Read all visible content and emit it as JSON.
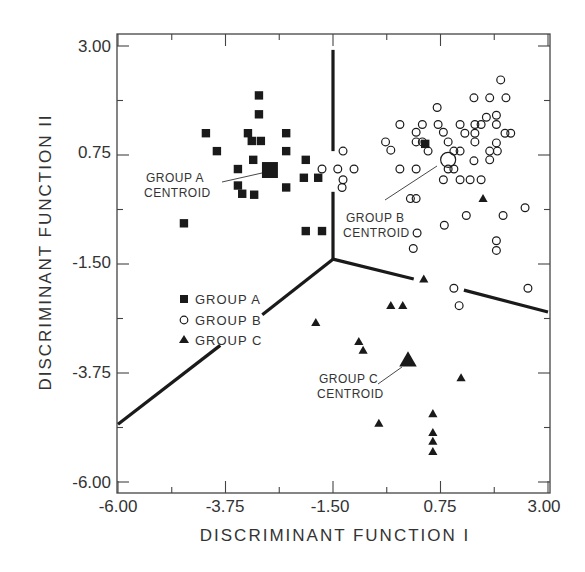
{
  "chart_data": {
    "type": "scatter",
    "title": "",
    "xlabel": "DISCRIMINANT FUNCTION I",
    "ylabel": "DISCRIMINANT FUNCTION II",
    "xlim": [
      -6.0,
      3.0
    ],
    "ylim": [
      -6.0,
      3.0
    ],
    "x_ticks": [
      "-6.00",
      "-3.75",
      "-1.50",
      "0.75",
      "3.00"
    ],
    "y_ticks": [
      "3.00",
      "0.75",
      "-1.50",
      "-3.75",
      "-6.00"
    ],
    "grid": false,
    "legend": {
      "position": "inside-left-middle",
      "entries": [
        {
          "label": "GROUP  A",
          "marker": "filled-square"
        },
        {
          "label": "GROUP  B",
          "marker": "open-circle"
        },
        {
          "label": "GROUP  C",
          "marker": "filled-triangle"
        }
      ]
    },
    "series": [
      {
        "name": "GROUP A",
        "marker": "filled-square",
        "points": [
          [
            -3.05,
            1.98
          ],
          [
            -3.05,
            1.59
          ],
          [
            -4.16,
            1.2
          ],
          [
            -3.28,
            1.2
          ],
          [
            -2.48,
            1.2
          ],
          [
            -3.2,
            1.04
          ],
          [
            -3.01,
            1.04
          ],
          [
            -3.93,
            0.83
          ],
          [
            -2.48,
            0.83
          ],
          [
            -3.17,
            0.65
          ],
          [
            -3.49,
            0.46
          ],
          [
            -2.07,
            0.65
          ],
          [
            -2.48,
            0.08
          ],
          [
            -3.49,
            0.12
          ],
          [
            -3.4,
            -0.05
          ],
          [
            -3.15,
            -0.07
          ],
          [
            -4.62,
            -0.66
          ],
          [
            -2.11,
            0.28
          ],
          [
            -1.81,
            0.28
          ],
          [
            -2.07,
            -0.82
          ],
          [
            -1.73,
            -0.82
          ],
          [
            0.43,
            0.98
          ]
        ],
        "centroid": [
          -2.82,
          0.44
        ]
      },
      {
        "name": "GROUP B",
        "marker": "open-circle",
        "points": [
          [
            2.01,
            2.3
          ],
          [
            1.45,
            1.93
          ],
          [
            1.78,
            1.93
          ],
          [
            2.12,
            1.93
          ],
          [
            0.68,
            1.73
          ],
          [
            -0.1,
            1.38
          ],
          [
            0.37,
            1.38
          ],
          [
            0.7,
            1.38
          ],
          [
            1.16,
            1.38
          ],
          [
            1.47,
            1.38
          ],
          [
            1.6,
            1.38
          ],
          [
            1.71,
            1.53
          ],
          [
            1.92,
            1.57
          ],
          [
            1.92,
            1.38
          ],
          [
            0.24,
            1.22
          ],
          [
            0.81,
            1.22
          ],
          [
            1.26,
            1.2
          ],
          [
            1.47,
            1.2
          ],
          [
            2.1,
            1.2
          ],
          [
            2.22,
            1.2
          ],
          [
            -0.4,
            1.02
          ],
          [
            0.24,
            1.02
          ],
          [
            0.37,
            1.02
          ],
          [
            0.91,
            1.02
          ],
          [
            1.47,
            1.02
          ],
          [
            1.92,
            1.0
          ],
          [
            -0.29,
            0.85
          ],
          [
            0.49,
            0.83
          ],
          [
            1.03,
            0.83
          ],
          [
            1.16,
            0.83
          ],
          [
            1.78,
            0.83
          ],
          [
            1.94,
            0.83
          ],
          [
            1.78,
            0.65
          ],
          [
            1.45,
            0.63
          ],
          [
            -0.1,
            0.46
          ],
          [
            0.24,
            0.46
          ],
          [
            0.91,
            0.46
          ],
          [
            1.03,
            0.46
          ],
          [
            0.81,
            0.24
          ],
          [
            1.16,
            0.24
          ],
          [
            1.37,
            0.24
          ],
          [
            1.6,
            0.24
          ],
          [
            -1.29,
            0.83
          ],
          [
            -1.73,
            0.46
          ],
          [
            -1.4,
            0.46
          ],
          [
            -1.06,
            0.46
          ],
          [
            -1.29,
            0.24
          ],
          [
            -1.31,
            0.08
          ],
          [
            0.12,
            -0.15
          ],
          [
            0.24,
            -0.15
          ],
          [
            1.29,
            -0.5
          ],
          [
            2.06,
            -0.5
          ],
          [
            2.52,
            -0.34
          ],
          [
            0.83,
            -0.7
          ],
          [
            0.26,
            -0.86
          ],
          [
            1.92,
            -1.02
          ],
          [
            1.92,
            -1.22
          ],
          [
            0.18,
            -1.18
          ],
          [
            1.03,
            -2.0
          ],
          [
            2.58,
            -2.0
          ],
          [
            1.14,
            -2.36
          ]
        ],
        "centroid": [
          0.91,
          0.65
        ]
      },
      {
        "name": "GROUP C",
        "marker": "filled-triangle",
        "points": [
          [
            1.64,
            -0.15
          ],
          [
            0.4,
            -1.81
          ],
          [
            -0.29,
            -2.36
          ],
          [
            -0.04,
            -2.36
          ],
          [
            -1.86,
            -2.71
          ],
          [
            -0.96,
            -3.1
          ],
          [
            -0.87,
            -3.28
          ],
          [
            1.18,
            -3.85
          ],
          [
            -0.54,
            -4.79
          ],
          [
            0.59,
            -4.59
          ],
          [
            0.59,
            -4.98
          ],
          [
            0.59,
            -5.16
          ],
          [
            0.59,
            -5.37
          ]
        ],
        "centroid": [
          0.07,
          -3.48
        ]
      }
    ],
    "boundaries": [
      {
        "name": "A-B boundary",
        "segments": [
          [
            [
              -1.5,
              2.92
            ],
            [
              -1.5,
              0.83
            ]
          ],
          [
            [
              -1.5,
              -0.01
            ],
            [
              -1.5,
              -1.4
            ]
          ]
        ]
      },
      {
        "name": "A-C boundary",
        "segments": [
          [
            [
              -1.5,
              -1.4
            ],
            [
              -2.98,
              -2.55
            ]
          ],
          [
            [
              -3.86,
              -3.18
            ],
            [
              -6.0,
              -4.81
            ]
          ]
        ]
      },
      {
        "name": "B-C boundary",
        "segments": [
          [
            [
              -1.5,
              -1.4
            ],
            [
              0.19,
              -1.81
            ]
          ],
          [
            [
              1.24,
              -2.04
            ],
            [
              3.0,
              -2.49
            ]
          ]
        ]
      }
    ],
    "annotations": [
      {
        "text_lines": [
          "GROUP A",
          "CENTROID"
        ],
        "points_to": "GROUP A centroid"
      },
      {
        "text_lines": [
          "GROUP B",
          "CENTROID"
        ],
        "points_to": "GROUP B centroid"
      },
      {
        "text_lines": [
          "GROUP C",
          "CENTROID"
        ],
        "points_to": "GROUP C centroid"
      }
    ]
  },
  "labels": {
    "xlabel": "DISCRIMINANT  FUNCTION  I",
    "ylabel": "DISCRIMINANT  FUNCTION  II",
    "x_ticks": [
      "-6.00",
      "-3.75",
      "-1.50",
      "0.75",
      "3.00"
    ],
    "y_ticks": [
      "3.00",
      "0.75",
      "-1.50",
      "-3.75",
      "-6.00"
    ],
    "legend": [
      "GROUP  A",
      "GROUP  B",
      "GROUP  C"
    ],
    "annot_a": [
      "GROUP A",
      "CENTROID"
    ],
    "annot_b": [
      "GROUP B",
      "CENTROID"
    ],
    "annot_c": [
      "GROUP C",
      "CENTROID"
    ]
  },
  "colors": {
    "ink": "#1a1a1a",
    "axis": "#444444",
    "text": "#333333",
    "background": "#ffffff"
  }
}
